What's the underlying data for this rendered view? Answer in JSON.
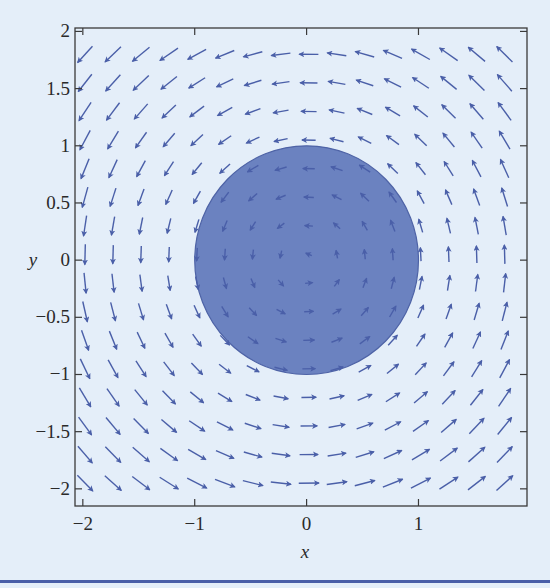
{
  "chart_data": {
    "type": "quiver",
    "title": "",
    "xlabel": "x",
    "ylabel": "y",
    "field": {
      "description": "F(x, y) = (-y, x), counterclockwise rotation",
      "u": "-y",
      "v": "x"
    },
    "grid": {
      "x_start": -1.98,
      "x_step": 0.25,
      "x_count": 16,
      "y_start": -1.95,
      "y_step": 0.25,
      "y_count": 16
    },
    "region": {
      "shape": "circle",
      "center": [
        0,
        0
      ],
      "radius": 1,
      "label": "unit disk (shaded)"
    },
    "xlim": [
      -2.07,
      1.97
    ],
    "ylim": [
      -2.15,
      2.03
    ],
    "xticks": [
      -2,
      -1,
      0,
      1
    ],
    "xtick_labels": [
      "−2",
      "−1",
      "0",
      "1"
    ],
    "yticks": [
      -2,
      -1.5,
      -1,
      -0.5,
      0,
      0.5,
      1,
      1.5,
      2
    ],
    "ytick_labels": [
      "−2",
      "−1.5",
      "−1",
      "−0.5",
      "0",
      "0.5",
      "1",
      "1.5",
      "2"
    ],
    "grid_lines": false,
    "legend": null
  },
  "colors": {
    "background": "#e4eef9",
    "arrow": "#4a5fa8",
    "disk_fill": "#6b82c0",
    "disk_stroke": "#4e63a6",
    "frame": "#3a3a3a"
  }
}
